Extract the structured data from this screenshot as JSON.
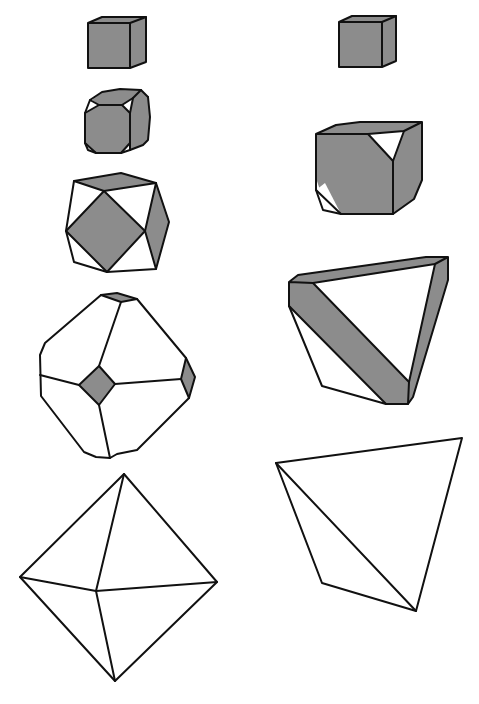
{
  "figure": {
    "colors": {
      "face_shaded": "#8c8c8c",
      "face_white": "#ffffff",
      "edge": "#111111",
      "background": "#ffffff"
    },
    "columns": [
      {
        "name": "cube-to-octahedron",
        "shapes": [
          {
            "id": "cube-left",
            "form": "cube"
          },
          {
            "id": "truncated-cube",
            "form": "cube truncated by octahedron"
          },
          {
            "id": "cuboctahedron",
            "form": "cuboctahedron"
          },
          {
            "id": "truncated-octahedron",
            "form": "octahedron truncated by cube"
          },
          {
            "id": "octahedron",
            "form": "octahedron"
          }
        ]
      },
      {
        "name": "cube-to-tetrahedron",
        "shapes": [
          {
            "id": "cube-right",
            "form": "cube"
          },
          {
            "id": "cube-tetra-truncated",
            "form": "cube truncated by tetrahedron"
          },
          {
            "id": "truncated-tetrahedron",
            "form": "tetrahedron truncated by cube"
          },
          {
            "id": "tetrahedron",
            "form": "tetrahedron"
          }
        ]
      }
    ]
  }
}
